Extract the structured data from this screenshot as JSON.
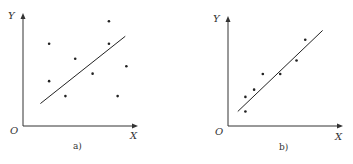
{
  "chart_data": [
    {
      "type": "scatter",
      "title": "",
      "caption": "a)",
      "xlabel": "X",
      "ylabel": "Y",
      "origin_label": "O",
      "xlim": [
        0,
        10
      ],
      "ylim": [
        0,
        10
      ],
      "grid": false,
      "points": [
        {
          "x": 2.4,
          "y": 7.7
        },
        {
          "x": 7.9,
          "y": 9.8
        },
        {
          "x": 7.9,
          "y": 7.7
        },
        {
          "x": 4.8,
          "y": 6.3
        },
        {
          "x": 6.4,
          "y": 4.9
        },
        {
          "x": 9.5,
          "y": 5.6
        },
        {
          "x": 2.4,
          "y": 4.2
        },
        {
          "x": 3.9,
          "y": 2.8
        },
        {
          "x": 8.7,
          "y": 2.8
        }
      ],
      "fit_line": {
        "x1": 1.6,
        "y1": 2.1,
        "x2": 9.4,
        "y2": 8.4
      }
    },
    {
      "type": "scatter",
      "title": "",
      "caption": "b)",
      "xlabel": "X",
      "ylabel": "Y",
      "origin_label": "O",
      "xlim": [
        0,
        10
      ],
      "ylim": [
        0,
        10
      ],
      "grid": false,
      "points": [
        {
          "x": 7.1,
          "y": 8.3
        },
        {
          "x": 6.3,
          "y": 6.3
        },
        {
          "x": 4.8,
          "y": 5.0
        },
        {
          "x": 3.2,
          "y": 5.0
        },
        {
          "x": 2.4,
          "y": 3.5
        },
        {
          "x": 1.6,
          "y": 2.8
        },
        {
          "x": 1.6,
          "y": 1.4
        }
      ],
      "fit_line": {
        "x1": 0.9,
        "y1": 1.4,
        "x2": 8.7,
        "y2": 9.2
      }
    }
  ]
}
